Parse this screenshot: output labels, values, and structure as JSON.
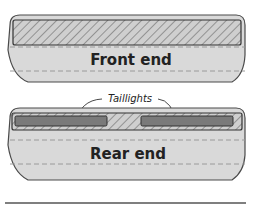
{
  "diagram": {
    "front": {
      "label": "Front end"
    },
    "rear": {
      "label": "Rear end",
      "callout": "Taillights"
    },
    "colors": {
      "body_fill": "#d9d9d9",
      "outline": "#4a4a4a",
      "hatch": "#555555",
      "hatch_bg": "#cfcfcf",
      "taillight": "#7a7a7a",
      "dashed": "#9a9a9a",
      "ground_line": "#555555"
    }
  }
}
